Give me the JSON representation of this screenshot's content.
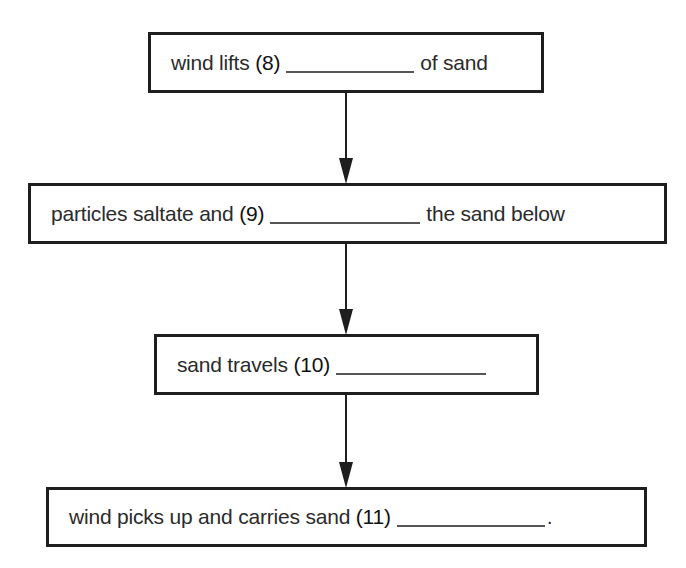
{
  "flowchart": {
    "steps": [
      {
        "pre": "wind lifts",
        "number": "(8)",
        "post": "of sand",
        "blank_width": 128
      },
      {
        "pre": "particles saltate and",
        "number": "(9)",
        "post": "the sand below",
        "blank_width": 150
      },
      {
        "pre": "sand travels",
        "number": "(10)",
        "post": "",
        "blank_width": 150
      },
      {
        "pre": "wind picks up and carries sand",
        "number": "(11)",
        "post": ".",
        "blank_width": 148
      }
    ],
    "connector": "down-arrow"
  }
}
